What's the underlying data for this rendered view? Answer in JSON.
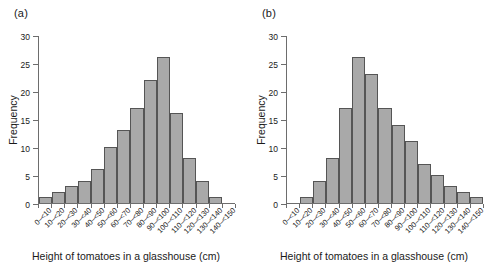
{
  "figure": {
    "background": "#ffffff",
    "bar_fill": "#a9a9a9",
    "bar_stroke": "#555555",
    "axis_color": "#6d6d6d"
  },
  "panels": [
    {
      "label": "(a)",
      "ylabel": "Frequency",
      "xlabel": "Height of tomatoes in a glasshouse (cm)"
    },
    {
      "label": "(b)",
      "ylabel": "Frequency",
      "xlabel": "Height of tomatoes in a glasshouse (cm)"
    }
  ],
  "chart_data": [
    {
      "type": "bar",
      "title": "(a)",
      "xlabel": "Height of tomatoes in a glasshouse (cm)",
      "ylabel": "Frequency",
      "categories": [
        "0–<10",
        "10–<20",
        "20–<30",
        "30–<40",
        "40–<50",
        "50–<60",
        "60–<70",
        "70–<80",
        "80–<90",
        "90–<100",
        "100–<110",
        "110–<120",
        "120–<130",
        "130–<140",
        "140–<150"
      ],
      "values": [
        1,
        2,
        3,
        4,
        6,
        10,
        13,
        17,
        22,
        26,
        16,
        8,
        4,
        1,
        0
      ],
      "ylim": [
        0,
        30
      ],
      "yticks": [
        0,
        5,
        10,
        15,
        20,
        25,
        30
      ],
      "grid": false,
      "legend": "none"
    },
    {
      "type": "bar",
      "title": "(b)",
      "xlabel": "Height of tomatoes in a glasshouse (cm)",
      "ylabel": "Frequency",
      "categories": [
        "0–<10",
        "10–<20",
        "20–<30",
        "30–<40",
        "40–<50",
        "50–<60",
        "60–<70",
        "70–<80",
        "80–<90",
        "90–<100",
        "100–<110",
        "110–<120",
        "120–<130",
        "130–<140",
        "140–<150"
      ],
      "values": [
        0,
        1,
        4,
        8,
        17,
        26,
        23,
        17,
        14,
        11,
        7,
        5,
        3,
        2,
        1
      ],
      "ylim": [
        0,
        30
      ],
      "yticks": [
        0,
        5,
        10,
        15,
        20,
        25,
        30
      ],
      "grid": false,
      "legend": "none"
    }
  ]
}
